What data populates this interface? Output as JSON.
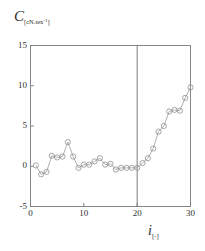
{
  "chart_data": {
    "type": "line",
    "title": "",
    "subtitle": "",
    "xlabel": "i",
    "xlabel_units": "[-]",
    "ylabel": "C",
    "ylabel_units": "[cN.tex-1]",
    "ylabel_units_base": "[cN.tex",
    "ylabel_units_exp": "-1",
    "ylabel_units_close": "]",
    "xlim": [
      0,
      30
    ],
    "ylim": [
      -5,
      15
    ],
    "xticks": [
      0,
      10,
      20,
      30
    ],
    "yticks": [
      -5,
      0,
      5,
      10,
      15
    ],
    "xtick_labels": [
      "0",
      "10",
      "20",
      "30"
    ],
    "ytick_labels": [
      "-5",
      "0",
      "5",
      "10",
      "15"
    ],
    "grid": false,
    "legend": false,
    "marker": "circle-open",
    "line_color": "#9a9a9a",
    "marker_color": "#8f8f8f",
    "axis_color": "#7a7a7a",
    "reference_line_x": 20,
    "x": [
      1,
      2,
      3,
      4,
      5,
      6,
      7,
      8,
      9,
      10,
      11,
      12,
      13,
      14,
      15,
      16,
      17,
      18,
      19,
      20,
      21,
      22,
      23,
      24,
      25,
      26,
      27,
      28,
      29,
      30
    ],
    "values": [
      0.1,
      -1.0,
      -0.7,
      1.3,
      1.1,
      1.2,
      3.0,
      1.2,
      -0.2,
      0.2,
      0.2,
      0.6,
      1.0,
      0.2,
      0.3,
      -0.4,
      -0.2,
      -0.2,
      -0.2,
      -0.2,
      0.4,
      1.0,
      2.2,
      4.3,
      5.0,
      6.8,
      7.0,
      6.9,
      8.5,
      9.8
    ],
    "series": [
      {
        "name": "C",
        "values": [
          0.1,
          -1.0,
          -0.7,
          1.3,
          1.1,
          1.2,
          3.0,
          1.2,
          -0.2,
          0.2,
          0.2,
          0.6,
          1.0,
          0.2,
          0.3,
          -0.4,
          -0.2,
          -0.2,
          -0.2,
          -0.2,
          0.4,
          1.0,
          2.2,
          4.3,
          5.0,
          6.8,
          7.0,
          6.9,
          8.5,
          9.8
        ]
      }
    ]
  }
}
